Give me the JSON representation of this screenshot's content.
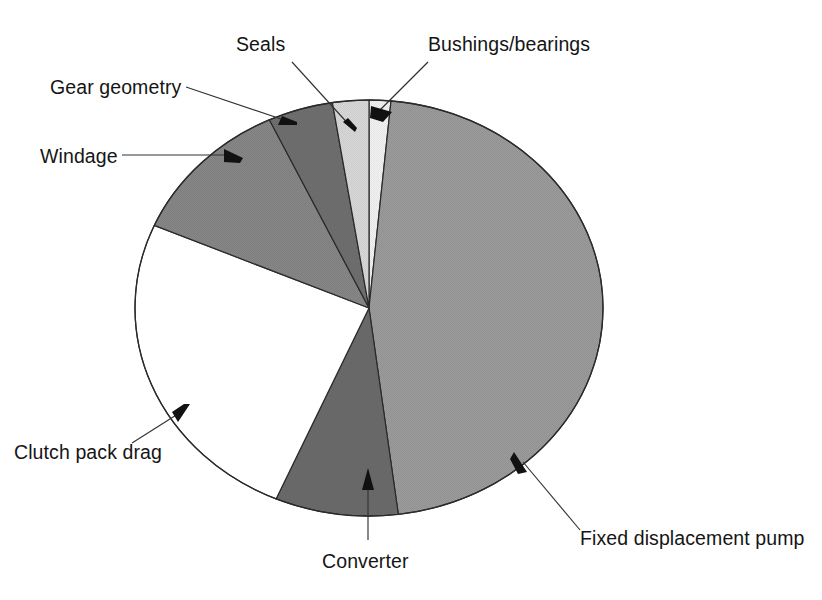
{
  "chart_data": {
    "type": "pie",
    "title": "",
    "subtitle": "",
    "xlabel": "",
    "ylabel": "",
    "legend_position": "none",
    "grid": false,
    "center": {
      "x": 369,
      "y": 308
    },
    "radius": {
      "rx": 234,
      "ry": 208
    },
    "start_angle_deg": -90,
    "direction": "clockwise",
    "categories": [
      "Bushings/bearings",
      "Fixed displacement pump",
      "Converter",
      "Clutch pack drag",
      "Windage",
      "Gear geometry",
      "Seals"
    ],
    "values": [
      1.5,
      46.5,
      8.5,
      25.0,
      11.5,
      4.5,
      2.5
    ],
    "colors": [
      "#f2f2f2",
      "#9b9b9b",
      "#6b6b6b",
      "#ffffff",
      "#868686",
      "#6f6f6f",
      "#d8d8d8"
    ],
    "slices": [
      {
        "label": "Bushings/bearings",
        "value": 1.5,
        "color": "#f2f2f2",
        "start_deg": -90.0,
        "end_deg": -84.6
      },
      {
        "label": "Fixed displacement pump",
        "value": 46.5,
        "color": "#9b9b9b",
        "start_deg": -84.6,
        "end_deg": 82.8
      },
      {
        "label": "Converter",
        "value": 8.5,
        "color": "#6b6b6b",
        "start_deg": 82.8,
        "end_deg": 113.4
      },
      {
        "label": "Clutch pack drag",
        "value": 25.0,
        "color": "#ffffff",
        "start_deg": 113.4,
        "end_deg": 203.4
      },
      {
        "label": "Windage",
        "value": 11.5,
        "color": "#868686",
        "start_deg": 203.4,
        "end_deg": 244.8
      },
      {
        "label": "Gear geometry",
        "value": 4.5,
        "color": "#6f6f6f",
        "start_deg": 244.8,
        "end_deg": 261.0
      },
      {
        "label": "Seals",
        "value": 2.5,
        "color": "#d8d8d8",
        "start_deg": 261.0,
        "end_deg": 270.0
      }
    ]
  },
  "labels": {
    "seals": "Seals",
    "bushings_bearings": "Bushings/bearings",
    "gear_geometry": "Gear geometry",
    "windage": "Windage",
    "clutch_pack_drag": "Clutch pack drag",
    "converter": "Converter",
    "fixed_displacement_pump": "Fixed displacement pump"
  },
  "style": {
    "background": "#ffffff",
    "text_color": "#151515",
    "leader_color": "#333333",
    "outline_color": "#2b2b2b"
  }
}
